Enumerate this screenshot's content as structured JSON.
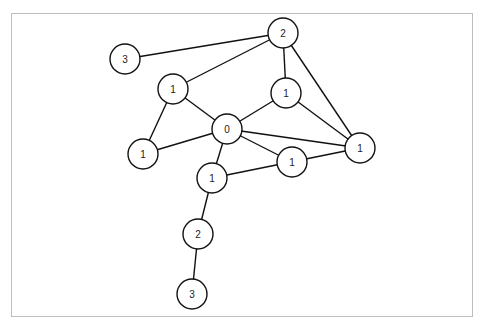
{
  "diagram": {
    "type": "graph",
    "frame": {
      "border_color": "#bdbdbd"
    },
    "node_radius": 15,
    "nodes": [
      {
        "id": "n0",
        "label": "0",
        "x": 227,
        "y": 129
      },
      {
        "id": "n_top",
        "label": "2",
        "x": 283,
        "y": 33
      },
      {
        "id": "n_topleft",
        "label": "3",
        "x": 125,
        "y": 59
      },
      {
        "id": "n_upleft",
        "label": "1",
        "x": 173,
        "y": 89
      },
      {
        "id": "n_upmid",
        "label": "1",
        "x": 286,
        "y": 93
      },
      {
        "id": "n_left",
        "label": "1",
        "x": 143,
        "y": 154
      },
      {
        "id": "n_right",
        "label": "1",
        "x": 360,
        "y": 148
      },
      {
        "id": "n_midright",
        "label": "1",
        "x": 292,
        "y": 162
      },
      {
        "id": "n_center",
        "label": "1",
        "x": 212,
        "y": 178
      },
      {
        "id": "n_low2",
        "label": "2",
        "x": 198,
        "y": 234
      },
      {
        "id": "n_bottom",
        "label": "3",
        "x": 192,
        "y": 294
      }
    ],
    "edges": [
      [
        "n_topleft",
        "n_top"
      ],
      [
        "n_upleft",
        "n_top"
      ],
      [
        "n_top",
        "n_upmid"
      ],
      [
        "n_top",
        "n_right"
      ],
      [
        "n_upleft",
        "n_left"
      ],
      [
        "n_upleft",
        "n_0"
      ],
      [
        "n_left",
        "n0"
      ],
      [
        "n_upmid",
        "n0"
      ],
      [
        "n_upmid",
        "n_right"
      ],
      [
        "n0",
        "n_right"
      ],
      [
        "n0",
        "n_midright"
      ],
      [
        "n0",
        "n_center"
      ],
      [
        "n_center",
        "n_right"
      ],
      [
        "n_center",
        "n_low2"
      ],
      [
        "n_low2",
        "n_bottom"
      ]
    ]
  }
}
